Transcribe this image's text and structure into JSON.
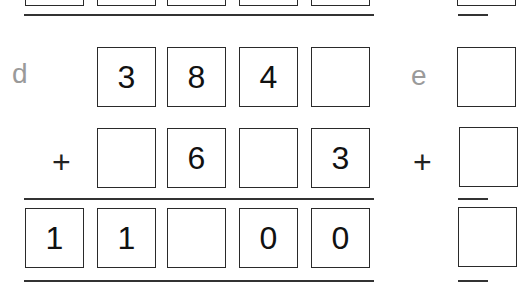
{
  "problems": {
    "d": {
      "label": "d",
      "operator": "+",
      "row1": [
        "",
        "3",
        "8",
        "4",
        ""
      ],
      "row2": [
        "",
        "",
        "6",
        "",
        "3"
      ],
      "result": [
        "1",
        "1",
        "",
        "0",
        "0"
      ]
    },
    "e": {
      "label": "e",
      "operator": "+"
    }
  }
}
